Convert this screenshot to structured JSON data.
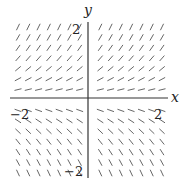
{
  "diagram": {
    "type": "slope-field",
    "axes": {
      "x_label": "x",
      "y_label": "y",
      "ticks": {
        "x_pos": "2",
        "x_neg": "−2",
        "y_pos": "2",
        "y_neg": "−2"
      },
      "range": {
        "x": [
          -2.5,
          2.5
        ],
        "y": [
          -2.5,
          2.5
        ]
      }
    },
    "grid": {
      "cols": 15,
      "rows": 15
    },
    "slope_function": "y",
    "colors": {
      "segment": "#555555",
      "axis": "#333333"
    }
  }
}
